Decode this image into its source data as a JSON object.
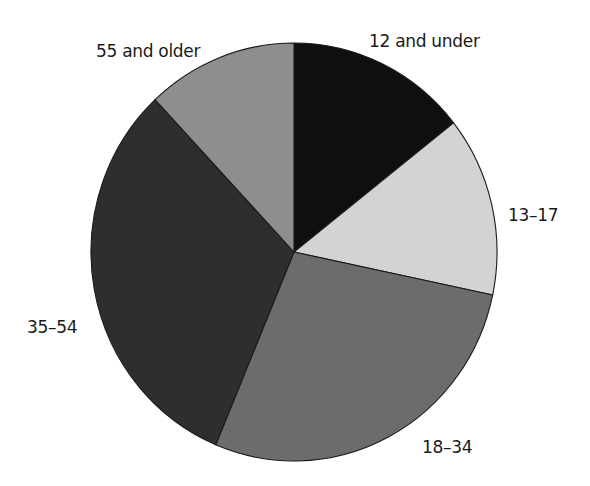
{
  "chart_data": {
    "type": "pie",
    "title": "",
    "unit": "percent (estimated from slice angles)",
    "start_angle_deg": 0,
    "direction": "clockwise",
    "categories": [
      "12 and under",
      "13–17",
      "18–34",
      "35–54",
      "55 and older"
    ],
    "values": [
      14.4,
      13.9,
      28.0,
      31.7,
      12.0
    ],
    "colors": [
      "#0f0f0f",
      "#d3d3d3",
      "#6c6c6c",
      "#2e2e2e",
      "#8e8e8e"
    ],
    "labels": [
      {
        "text": "12 and under",
        "x": 369,
        "y": 47,
        "anchor": "start"
      },
      {
        "text": "13–17",
        "x": 508,
        "y": 221,
        "anchor": "start"
      },
      {
        "text": "18–34",
        "x": 422,
        "y": 453,
        "anchor": "start"
      },
      {
        "text": "35–54",
        "x": 27,
        "y": 333,
        "anchor": "start"
      },
      {
        "text": "55 and older",
        "x": 96,
        "y": 57,
        "anchor": "start"
      }
    ],
    "legend": "none",
    "geometry": {
      "cx": 294,
      "cy": 252,
      "rx": 203,
      "ry": 209
    }
  }
}
